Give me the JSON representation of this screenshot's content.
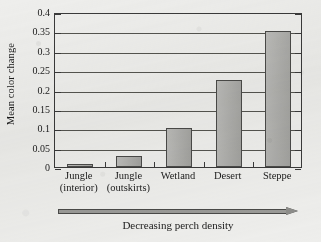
{
  "chart_data": {
    "type": "bar",
    "title": "",
    "xlabel": "Decreasing perch density",
    "ylabel": "Mean color change",
    "categories": [
      "Jungle (interior)",
      "Jungle (outskirts)",
      "Wetland",
      "Desert",
      "Steppe"
    ],
    "category_lines": [
      [
        "Jungle",
        "(interior)"
      ],
      [
        "Jungle",
        "(outskirts)"
      ],
      [
        "Wetland",
        ""
      ],
      [
        "Desert",
        ""
      ],
      [
        "Steppe",
        ""
      ]
    ],
    "values": [
      0.008,
      0.028,
      0.1,
      0.225,
      0.35
    ],
    "ylim": [
      0,
      0.4
    ],
    "ytick_values": [
      0,
      0.05,
      0.1,
      0.15,
      0.2,
      0.25,
      0.3,
      0.35,
      0.4
    ],
    "ytick_labels": [
      "0",
      "0.05",
      "0.1",
      "0.15",
      "0.2",
      "0.25",
      "0.3",
      "0.35",
      "0.4"
    ],
    "grid": true,
    "legend": false,
    "bar_color": "#a9a9a6",
    "bar_edge_color": "#4a4a48",
    "axis_color": "#3a3a3a",
    "grid_color": "#54544f"
  },
  "annotation": {
    "arrow_caption": "Decreasing perch density",
    "arrow_direction": "right"
  }
}
